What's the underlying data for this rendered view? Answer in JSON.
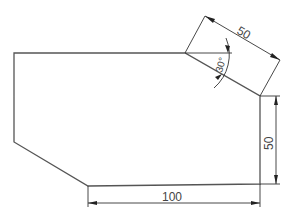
{
  "drawing": {
    "shape": "hexagonal plate with chamfered corners",
    "dimensions": {
      "slant_edge": "50",
      "right_edge": "50",
      "bottom_edge": "100",
      "angle": "30°"
    },
    "colors": {
      "outline": "#555555",
      "dimension": "#333333",
      "text": "#444444",
      "background": "#ffffff"
    }
  }
}
